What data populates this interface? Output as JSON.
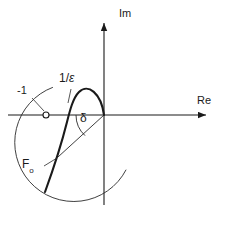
{
  "figure": {
    "type": "complex-plane-nyquist-diagram",
    "background_color": "#ffffff",
    "stroke_color": "#1a1a1a",
    "width": 230,
    "height": 228
  },
  "axes": {
    "real_axis_label": "Re",
    "imag_axis_label": "Im",
    "origin": {
      "x": 104,
      "y": 115
    },
    "real_axis": {
      "x1": 8,
      "y1": 115,
      "x2": 213,
      "y2": 115,
      "arrow": "right"
    },
    "imag_axis": {
      "x1": 104,
      "y1": 205,
      "x2": 104,
      "y2": 16,
      "arrow": "up"
    }
  },
  "labels": {
    "minus_one": "-1",
    "one_over_epsilon_num": "1/",
    "one_over_epsilon_den": "ε",
    "angle_delta": "δ",
    "locus_name": "F",
    "locus_subscript": "o"
  },
  "markers": {
    "critical_point": {
      "name": "-1",
      "x": 46,
      "y": 115,
      "radius": 3,
      "fill": "#ffffff"
    }
  },
  "curves": {
    "epsilon_circle": {
      "description": "arc of circle of radius 1/epsilon centred at origin",
      "center_x": 104,
      "center_y": 115,
      "radius": 59,
      "start_angle_deg": 152,
      "end_angle_deg": 292
    },
    "nyquist_locus": {
      "description": "F_o locus, thick curve crossing the real axis and looping near the origin"
    },
    "delta_ray": {
      "description": "straight ray from origin to the locus intersection point",
      "x1": 104,
      "y1": 115,
      "x2": 58,
      "y2": 157
    },
    "delta_arc": {
      "description": "arc indicating angle delta between the ray and the negative-going direction",
      "center_x": 104,
      "center_y": 115,
      "radius": 28
    }
  },
  "leaders": {
    "minus_one_leader": {
      "x1": 32,
      "y1": 98,
      "x2": 44,
      "y2": 112
    },
    "epsilon_leader": {
      "x1": 71,
      "y1": 88,
      "x2": 68,
      "y2": 103
    },
    "locus_leader": {
      "x1": 45,
      "y1": 166,
      "x2": 57,
      "y2": 159
    }
  },
  "label_positions": {
    "minus_one": {
      "x": 17,
      "y": 86
    },
    "one_over_epsilon": {
      "x": 60,
      "y": 74
    },
    "angle_delta": {
      "x": 80,
      "y": 114
    },
    "locus_name": {
      "x": 22,
      "y": 161
    },
    "imag": {
      "x": 119,
      "y": 10
    },
    "real": {
      "x": 197,
      "y": 97
    }
  }
}
